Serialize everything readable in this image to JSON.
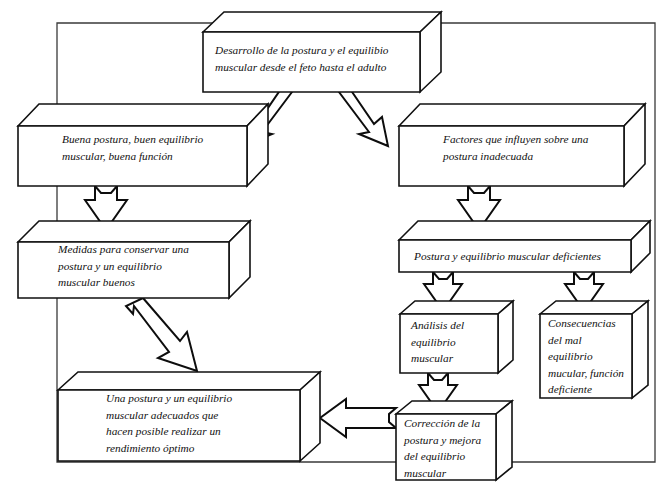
{
  "diagram": {
    "title_text": "Desarrollo de la postura y el equilibio muscular desde el feto hasta el adulto",
    "language": "es",
    "frame_color": "#3a3a3a",
    "box_stroke_color": "#111111",
    "box_fill_color": "#ffffff",
    "arrow_stroke_color": "#0d0d0d"
  },
  "nodes": {
    "development": {
      "id": "development",
      "lines": [
        "Desarrollo de la postura y el equilibio",
        "muscular desde el feto hasta el adulto"
      ]
    },
    "good_posture": {
      "id": "good_posture",
      "lines": [
        "Buena postura, buen equilibrio",
        "muscular, buena función"
      ]
    },
    "factors": {
      "id": "factors",
      "lines": [
        "Factores que influyen sobre una",
        "postura inadecuada"
      ]
    },
    "measures": {
      "id": "measures",
      "lines": [
        "Medidas para conservar una",
        "postura y un equilibrio",
        "muscular buenos"
      ]
    },
    "deficient": {
      "id": "deficient",
      "lines": [
        "Postura y equilibrio muscular deficientes"
      ]
    },
    "analysis": {
      "id": "analysis",
      "lines": [
        "Análisis del",
        "equilibrio",
        "muscular"
      ]
    },
    "consequences": {
      "id": "consequences",
      "lines": [
        "Consecuencias",
        "del mal",
        "equilibrio",
        "mucular, función",
        "deficiente"
      ]
    },
    "outcome": {
      "id": "outcome",
      "lines": [
        "Una postura y un equilibrio",
        "muscular adecuados que",
        "hacen posible realizar un",
        "rendimiento óptimo"
      ]
    },
    "correction": {
      "id": "correction",
      "lines": [
        "Corrección de la",
        "postura y mejora",
        "del equilibrio",
        "muscular"
      ]
    }
  },
  "edges": [
    {
      "from": "development",
      "to": "good_posture",
      "direction": "down-left"
    },
    {
      "from": "development",
      "to": "factors",
      "direction": "down-right"
    },
    {
      "from": "good_posture",
      "to": "measures",
      "direction": "down"
    },
    {
      "from": "factors",
      "to": "deficient",
      "direction": "down"
    },
    {
      "from": "measures",
      "to": "outcome",
      "direction": "down-right"
    },
    {
      "from": "deficient",
      "to": "analysis",
      "direction": "down"
    },
    {
      "from": "deficient",
      "to": "consequences",
      "direction": "down"
    },
    {
      "from": "analysis",
      "to": "correction",
      "direction": "down"
    },
    {
      "from": "correction",
      "to": "outcome",
      "direction": "left"
    }
  ]
}
